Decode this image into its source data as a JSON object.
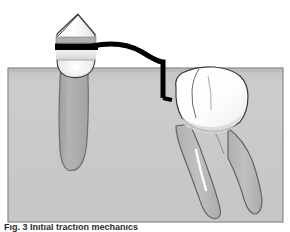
{
  "figure": {
    "caption": "Fig. 3  Initial traction mechanics",
    "colors": {
      "background": "#ffffff",
      "bone_block": "#c9c9c9",
      "bone_block_border": "#8a8a8a",
      "bone_block_top_highlight": "#bdbdbd",
      "tooth_enamel": "#ffffff",
      "tooth_outline": "#3c3c3c",
      "root_dentin": "#b2b2b2",
      "root_outline": "#6e6e6e",
      "band_gray": "#b8b8b8",
      "band_light": "#e8e8e8",
      "band_black": "#000000",
      "wire": "#000000",
      "shadow_gray": "#b5b5b5",
      "caption_text": "#2b2b2b"
    }
  },
  "bone_block": {
    "label": "alveolar-bone-block",
    "x": 8,
    "y": 68,
    "width": 275,
    "height": 154
  },
  "left_tooth": {
    "label": "banded-premolar",
    "crown_label": "premolar-crown",
    "root_label": "premolar-root",
    "cusp_apex_x": 78,
    "crown_top_y": 14,
    "bands": [
      {
        "name": "upper-gray-band",
        "y": 38,
        "height": 5,
        "color": "#b0b0b0"
      },
      {
        "name": "black-bracket-band",
        "y": 44,
        "height": 6,
        "color": "#000000"
      },
      {
        "name": "lower-light-band",
        "y": 50,
        "height": 10,
        "color": "#e6e6e6"
      }
    ]
  },
  "wire": {
    "label": "traction-wire",
    "stroke_width": 5,
    "description": "curved arch wire from premolar band bending down to impacted molar"
  },
  "right_tooth": {
    "label": "impacted-tilted-molar",
    "crown_label": "molar-crown",
    "roots": [
      {
        "name": "mesial-root"
      },
      {
        "name": "distal-root"
      }
    ],
    "tilt": "mesio-angular"
  }
}
